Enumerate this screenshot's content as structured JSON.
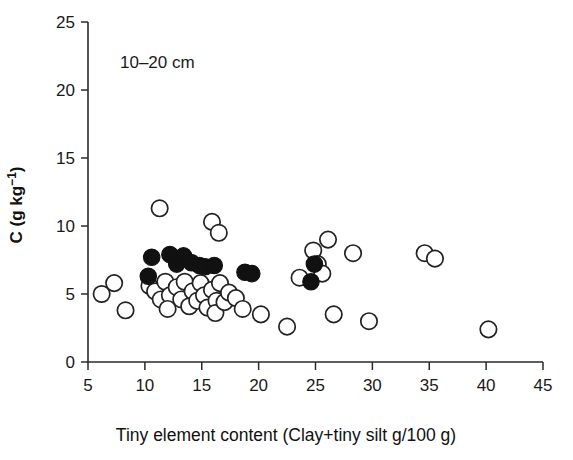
{
  "figure": {
    "annotation": "10–20 cm",
    "background": "#ffffff",
    "point_color_open": "#ffffff",
    "point_edge_color": "#222222",
    "point_color_filled": "#111111"
  },
  "chart_data": {
    "type": "scatter",
    "title": "",
    "annotation": "10–20 cm",
    "xlabel": "Tiny element content (Clay+tiny silt g/100 g)",
    "ylabel": "C (g kg-1)",
    "ylabel_parts": {
      "base": "C (g kg",
      "sup": "−1",
      "close": ")"
    },
    "xlim": [
      5,
      45
    ],
    "ylim": [
      0,
      25
    ],
    "xticks": [
      5,
      10,
      15,
      20,
      25,
      30,
      35,
      40,
      45
    ],
    "xticklabels": [
      "5",
      "10",
      "15",
      "20",
      "25",
      "30",
      "35",
      "40",
      "45"
    ],
    "yticks": [
      0,
      5,
      10,
      15,
      20,
      25
    ],
    "yticklabels": [
      "0",
      "5",
      "10",
      "15",
      "20",
      "25"
    ],
    "grid": false,
    "legend": null,
    "series": [
      {
        "name": "open",
        "marker": "open-circle",
        "points": [
          [
            6.2,
            5.0
          ],
          [
            7.3,
            5.8
          ],
          [
            8.3,
            3.8
          ],
          [
            11.3,
            11.3
          ],
          [
            15.9,
            10.3
          ],
          [
            16.5,
            9.5
          ],
          [
            10.4,
            5.6
          ],
          [
            10.9,
            5.2
          ],
          [
            11.4,
            4.6
          ],
          [
            11.8,
            5.9
          ],
          [
            12.2,
            4.9
          ],
          [
            12.0,
            3.9
          ],
          [
            12.8,
            5.5
          ],
          [
            13.2,
            4.6
          ],
          [
            13.5,
            5.9
          ],
          [
            13.9,
            4.1
          ],
          [
            14.2,
            5.2
          ],
          [
            14.6,
            4.5
          ],
          [
            14.9,
            5.8
          ],
          [
            15.2,
            4.9
          ],
          [
            15.5,
            4.0
          ],
          [
            15.9,
            5.3
          ],
          [
            16.3,
            4.5
          ],
          [
            16.6,
            5.8
          ],
          [
            16.2,
            3.6
          ],
          [
            17.0,
            4.4
          ],
          [
            17.4,
            5.1
          ],
          [
            18.0,
            4.7
          ],
          [
            18.6,
            3.9
          ],
          [
            20.2,
            3.5
          ],
          [
            22.5,
            2.6
          ],
          [
            24.8,
            8.2
          ],
          [
            25.2,
            7.2
          ],
          [
            23.6,
            6.2
          ],
          [
            25.6,
            6.5
          ],
          [
            26.1,
            9.0
          ],
          [
            28.3,
            8.0
          ],
          [
            26.6,
            3.5
          ],
          [
            29.7,
            3.0
          ],
          [
            34.6,
            8.0
          ],
          [
            35.5,
            7.6
          ],
          [
            40.2,
            2.4
          ]
        ]
      },
      {
        "name": "filled",
        "marker": "filled-circle",
        "points": [
          [
            10.6,
            7.7
          ],
          [
            10.3,
            6.3
          ],
          [
            12.2,
            7.9
          ],
          [
            12.8,
            7.2
          ],
          [
            13.4,
            7.8
          ],
          [
            14.1,
            7.3
          ],
          [
            14.8,
            7.1
          ],
          [
            15.3,
            7.0
          ],
          [
            16.1,
            7.1
          ],
          [
            18.8,
            6.6
          ],
          [
            19.4,
            6.5
          ],
          [
            24.9,
            7.2
          ],
          [
            24.6,
            5.9
          ]
        ]
      }
    ]
  }
}
